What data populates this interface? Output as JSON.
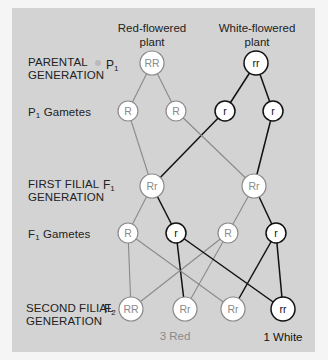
{
  "headers": {
    "red_plant": "Red-flowered plant",
    "red_plant_line1": "Red-flowered",
    "red_plant_line2": "plant",
    "white_plant_line1": "White-flowered",
    "white_plant_line2": "plant"
  },
  "rows": [
    {
      "id": "parental",
      "label_line1": "PARENTAL",
      "label_line2": "GENERATION",
      "symbol": "P",
      "subscript": "1"
    },
    {
      "id": "p1-gametes",
      "symbol": "P",
      "subscript": "1",
      "label": "Gametes"
    },
    {
      "id": "first-filial",
      "label_line1": "FIRST FILIAL",
      "label_line2": "GENERATION",
      "symbol": "F",
      "subscript": "1"
    },
    {
      "id": "f1-gametes",
      "symbol": "F",
      "subscript": "1",
      "label": "Gametes"
    },
    {
      "id": "second-filial",
      "label_line1": "SECOND FILIAL",
      "label_line2": "GENERATION",
      "symbol": "F",
      "subscript": "2"
    }
  ],
  "colors": {
    "panel_bg": "#d3d3d3",
    "page_bg": "#f5f5f5",
    "dominant_line": "#8a8a8a",
    "recessive_line": "#111111",
    "dominant_text": "#8a8a8a",
    "recessive_text": "#111111",
    "node_fill": "#ffffff"
  },
  "nodes": {
    "p1_red": {
      "label": "RR",
      "x": 152,
      "y": 63,
      "r": 12,
      "type": "dominant"
    },
    "p1_white": {
      "label": "rr",
      "x": 256,
      "y": 63,
      "r": 12,
      "type": "recessive"
    },
    "p1g_1": {
      "label": "R",
      "x": 128,
      "y": 111,
      "r": 10,
      "type": "dominant"
    },
    "p1g_2": {
      "label": "R",
      "x": 176,
      "y": 111,
      "r": 10,
      "type": "dominant"
    },
    "p1g_3": {
      "label": "r",
      "x": 225,
      "y": 111,
      "r": 10,
      "type": "recessive"
    },
    "p1g_4": {
      "label": "r",
      "x": 273,
      "y": 111,
      "r": 10,
      "type": "recessive"
    },
    "f1_a": {
      "label": "Rr",
      "x": 152,
      "y": 186,
      "r": 12,
      "type": "dominant"
    },
    "f1_b": {
      "label": "Rr",
      "x": 254,
      "y": 186,
      "r": 12,
      "type": "dominant"
    },
    "f1g_1": {
      "label": "R",
      "x": 128,
      "y": 233,
      "r": 10,
      "type": "dominant"
    },
    "f1g_2": {
      "label": "r",
      "x": 176,
      "y": 233,
      "r": 10,
      "type": "recessive"
    },
    "f1g_3": {
      "label": "R",
      "x": 228,
      "y": 233,
      "r": 10,
      "type": "dominant"
    },
    "f1g_4": {
      "label": "r",
      "x": 276,
      "y": 233,
      "r": 10,
      "type": "recessive"
    },
    "f2_1": {
      "label": "RR",
      "x": 131,
      "y": 309,
      "r": 12,
      "type": "dominant"
    },
    "f2_2": {
      "label": "Rr",
      "x": 185,
      "y": 309,
      "r": 12,
      "type": "dominant"
    },
    "f2_3": {
      "label": "Rr",
      "x": 233,
      "y": 309,
      "r": 12,
      "type": "dominant"
    },
    "f2_4": {
      "label": "rr",
      "x": 283,
      "y": 309,
      "r": 12,
      "type": "recessive"
    }
  },
  "edges": [
    {
      "from": "p1_red",
      "to": "p1g_1",
      "type": "dominant"
    },
    {
      "from": "p1_red",
      "to": "p1g_2",
      "type": "dominant"
    },
    {
      "from": "p1_white",
      "to": "p1g_3",
      "type": "recessive"
    },
    {
      "from": "p1_white",
      "to": "p1g_4",
      "type": "recessive"
    },
    {
      "from": "p1g_1",
      "to": "f1_a",
      "type": "dominant"
    },
    {
      "from": "p1g_3",
      "to": "f1_a",
      "type": "recessive"
    },
    {
      "from": "p1g_2",
      "to": "f1_b",
      "type": "dominant"
    },
    {
      "from": "p1g_4",
      "to": "f1_b",
      "type": "recessive"
    },
    {
      "from": "f1_a",
      "to": "f1g_1",
      "type": "dominant"
    },
    {
      "from": "f1_a",
      "to": "f1g_2",
      "type": "recessive"
    },
    {
      "from": "f1_b",
      "to": "f1g_3",
      "type": "dominant"
    },
    {
      "from": "f1_b",
      "to": "f1g_4",
      "type": "recessive"
    },
    {
      "from": "f1g_1",
      "to": "f2_1",
      "type": "dominant"
    },
    {
      "from": "f1g_3",
      "to": "f2_1",
      "type": "dominant"
    },
    {
      "from": "f1g_2",
      "to": "f2_2",
      "type": "recessive"
    },
    {
      "from": "f1g_3",
      "to": "f2_2",
      "type": "dominant"
    },
    {
      "from": "f1g_1",
      "to": "f2_3",
      "type": "dominant"
    },
    {
      "from": "f1g_4",
      "to": "f2_3",
      "type": "recessive"
    },
    {
      "from": "f1g_2",
      "to": "f2_4",
      "type": "recessive"
    },
    {
      "from": "f1g_4",
      "to": "f2_4",
      "type": "recessive"
    }
  ],
  "results": {
    "red_count": "3 Red",
    "white_count": "1 White"
  }
}
